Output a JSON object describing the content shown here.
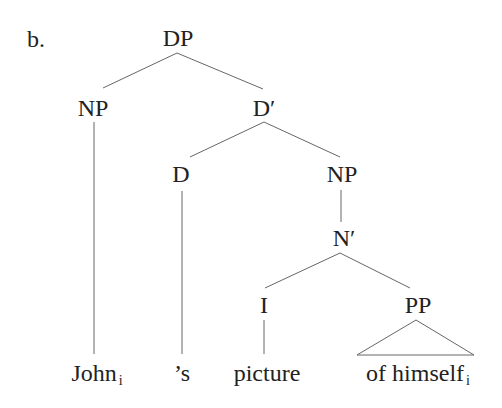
{
  "example_label": "b.",
  "tree": {
    "nodes": {
      "dp": "DP",
      "np_spec": "NP",
      "d_bar": "D′",
      "d": "D",
      "np_comp": "NP",
      "n_bar": "N′",
      "i": "I",
      "pp": "PP"
    },
    "leaves": {
      "john": "John",
      "john_index": "i",
      "s": "’s",
      "picture": "picture",
      "of_himself": "of himself",
      "of_himself_index": "i"
    },
    "structure": "[DP [NP John_i] [D' [D 's] [NP [N' [I picture] [PP of himself_i]]]]]"
  },
  "colors": {
    "text": "#222222",
    "lines": "#555555",
    "background": "#ffffff"
  }
}
